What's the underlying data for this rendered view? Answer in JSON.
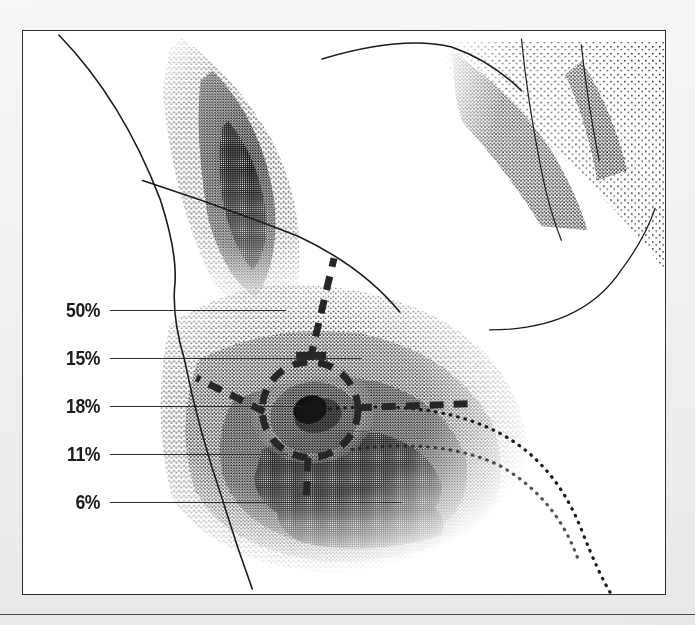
{
  "figure": {
    "medium": "stippled pen-and-ink anatomical illustration",
    "panel": {
      "background_color": "#ffffff",
      "border_color": "#2b2b2b"
    },
    "page_background_color": "#f2f2f0",
    "ink_color": "#1a1a1a"
  },
  "callouts": [
    {
      "label": "50%",
      "value": 50,
      "y": 310,
      "label_right_x": 100,
      "line_end_x": 276,
      "name": "callout-50"
    },
    {
      "label": "15%",
      "value": 15,
      "y": 358,
      "label_right_x": 100,
      "line_end_x": 352,
      "name": "callout-15"
    },
    {
      "label": "18%",
      "value": 18,
      "y": 406,
      "label_right_x": 100,
      "line_end_x": 292,
      "name": "callout-18"
    },
    {
      "label": "11%",
      "value": 11,
      "y": 454,
      "label_right_x": 100,
      "line_end_x": 278,
      "name": "callout-11"
    },
    {
      "label": "6%",
      "value": 6,
      "y": 502,
      "label_right_x": 100,
      "line_end_x": 392,
      "name": "callout-6"
    }
  ],
  "markers": {
    "areola_circle": {
      "center_x": 310,
      "center_y": 410,
      "radius": 48,
      "style": "dashed",
      "stroke_color": "#262626"
    },
    "duct_line": {
      "from_x": 310,
      "from_y": 360,
      "to_x": 334,
      "to_y": 257,
      "style": "dashed"
    },
    "lateral_line": {
      "from_x": 356,
      "from_y": 408,
      "to_x": 470,
      "to_y": 404,
      "style": "dashed"
    },
    "medial_line": {
      "from_x": 264,
      "from_y": 412,
      "to_x": 196,
      "to_y": 378,
      "style": "dashed"
    },
    "inferior_line": {
      "from_x": 308,
      "from_y": 458,
      "to_x": 306,
      "to_y": 500,
      "style": "dashed"
    }
  },
  "bottom_rule": {
    "y": 614,
    "color": "#4a4a4a"
  }
}
